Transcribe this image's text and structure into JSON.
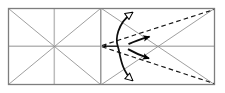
{
  "diagram": {
    "canvas": {
      "width": 225,
      "height": 93
    },
    "colors": {
      "frame": "#7c7c7c",
      "construction_line": "#9a9a9a",
      "center_line": "#b0b0b0",
      "fold_line": "#1a1a1a",
      "arrow": "#000000",
      "background": "#ffffff"
    },
    "geometry": {
      "frame": {
        "x": 8,
        "y": 8,
        "width": 207,
        "height": 77
      },
      "divider_x": 101,
      "left_square": {
        "x": 8,
        "y": 8,
        "width": 93,
        "height": 77
      },
      "right_square": {
        "x": 101,
        "y": 8,
        "width": 114,
        "height": 77
      },
      "left_center": {
        "x": 54,
        "y": 46
      },
      "vertex": {
        "x": 101,
        "y": 46
      }
    },
    "elements": [
      {
        "name": "outer-frame",
        "kind": "rectangle",
        "style": "solid-gray"
      },
      {
        "name": "center-divider",
        "kind": "line",
        "style": "solid-gray"
      },
      {
        "name": "horizontal-center-line",
        "kind": "line",
        "style": "solid-light-gray"
      },
      {
        "name": "left-vertical-center-line",
        "kind": "line",
        "style": "solid-light-gray"
      },
      {
        "name": "left-diagonal-1",
        "kind": "line",
        "style": "solid-gray"
      },
      {
        "name": "left-diagonal-2",
        "kind": "line",
        "style": "solid-gray"
      },
      {
        "name": "right-diagonal-1",
        "kind": "line",
        "style": "solid-gray"
      },
      {
        "name": "right-diagonal-2",
        "kind": "line",
        "style": "solid-gray"
      },
      {
        "name": "fold-line-upper",
        "kind": "line",
        "style": "dashed-black"
      },
      {
        "name": "fold-line-lower",
        "kind": "line",
        "style": "dashed-black"
      },
      {
        "name": "fold-arc-double-headed",
        "kind": "arc",
        "style": "solid-black",
        "arrowheads": "hollow-both-ends"
      },
      {
        "name": "fold-arrow-upper",
        "kind": "arc",
        "style": "solid-black",
        "arrowheads": "filled-end"
      },
      {
        "name": "fold-arrow-lower",
        "kind": "arc",
        "style": "solid-black",
        "arrowheads": "filled-end"
      },
      {
        "name": "vertex-arrow-left",
        "kind": "arrow",
        "style": "solid-black",
        "arrowheads": "filled-end"
      }
    ],
    "labels": []
  }
}
